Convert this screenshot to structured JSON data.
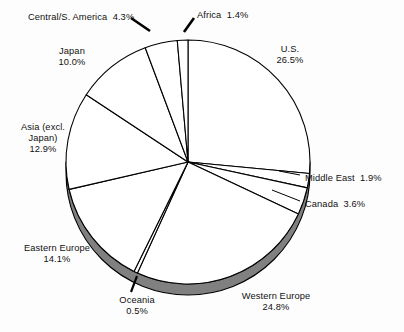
{
  "chart_data": {
    "type": "pie",
    "title": "",
    "subtitle": "",
    "xlabel": "",
    "ylabel": "",
    "units": "percent",
    "legend_position": "none",
    "grid": false,
    "total": 100.0,
    "start_angle_deg": 0,
    "direction": "clockwise",
    "categories": [
      "U.S.",
      "Middle East",
      "Canada",
      "Western Europe",
      "Oceania",
      "Eastern Europe",
      "Asia (excl. Japan)",
      "Japan",
      "Central/S. America",
      "Africa"
    ],
    "values": [
      26.5,
      1.9,
      3.6,
      24.8,
      0.5,
      14.1,
      12.9,
      10.0,
      4.3,
      1.4
    ],
    "slices": [
      {
        "name": "U.S.",
        "value": 26.5,
        "value_text": "26.5%",
        "label_lines": [
          "U.S.",
          "26.5%"
        ],
        "leader": false
      },
      {
        "name": "Middle East",
        "value": 1.9,
        "value_text": "1.9%",
        "label_lines": [
          "Middle East  1.9%"
        ],
        "leader": true
      },
      {
        "name": "Canada",
        "value": 3.6,
        "value_text": "3.6%",
        "label_lines": [
          "Canada  3.6%"
        ],
        "leader": true
      },
      {
        "name": "Western Europe",
        "value": 24.8,
        "value_text": "24.8%",
        "label_lines": [
          "Western Europe",
          "24.8%"
        ],
        "leader": false
      },
      {
        "name": "Oceania",
        "value": 0.5,
        "value_text": "0.5%",
        "label_lines": [
          "Oceania",
          "0.5%"
        ],
        "leader": true
      },
      {
        "name": "Eastern Europe",
        "value": 14.1,
        "value_text": "14.1%",
        "label_lines": [
          "Eastern Europe",
          "14.1%"
        ],
        "leader": false
      },
      {
        "name": "Asia (excl. Japan)",
        "value": 12.9,
        "value_text": "12.9%",
        "label_lines": [
          "Asia (excl.",
          "Japan)",
          "12.9%"
        ],
        "leader": false
      },
      {
        "name": "Japan",
        "value": 10.0,
        "value_text": "10.0%",
        "label_lines": [
          "Japan",
          "10.0%"
        ],
        "leader": false
      },
      {
        "name": "Central/S. America",
        "value": 4.3,
        "value_text": "4.3%",
        "label_lines": [
          "Central/S. America  4.3%"
        ],
        "leader": true
      },
      {
        "name": "Africa",
        "value": 1.4,
        "value_text": "1.4%",
        "label_lines": [
          "Africa  1.4%"
        ],
        "leader": true
      }
    ],
    "colors": {
      "slice_fill": "#ffffff",
      "slice_outline": "#000000",
      "depth_rim": "#808080",
      "depth_rim_outline": "#000000",
      "background": "#fdfdfd",
      "text": "#111111",
      "leader_line": "#000000"
    }
  },
  "labels": {
    "central_s_america": "Central/S. America  4.3%",
    "africa": "Africa  1.4%",
    "us_name": "U.S.",
    "us_value": "26.5%",
    "japan_name": "Japan",
    "japan_value": "10.0%",
    "asia_line1": "Asia (excl.",
    "asia_line2": "Japan)",
    "asia_value": "12.9%",
    "middle_east": "Middle East  1.9%",
    "canada": "Canada  3.6%",
    "eastern_europe_name": "Eastern Europe",
    "eastern_europe_value": "14.1%",
    "oceania_name": "Oceania",
    "oceania_value": "0.5%",
    "western_europe_name": "Western Europe",
    "western_europe_value": "24.8%"
  }
}
